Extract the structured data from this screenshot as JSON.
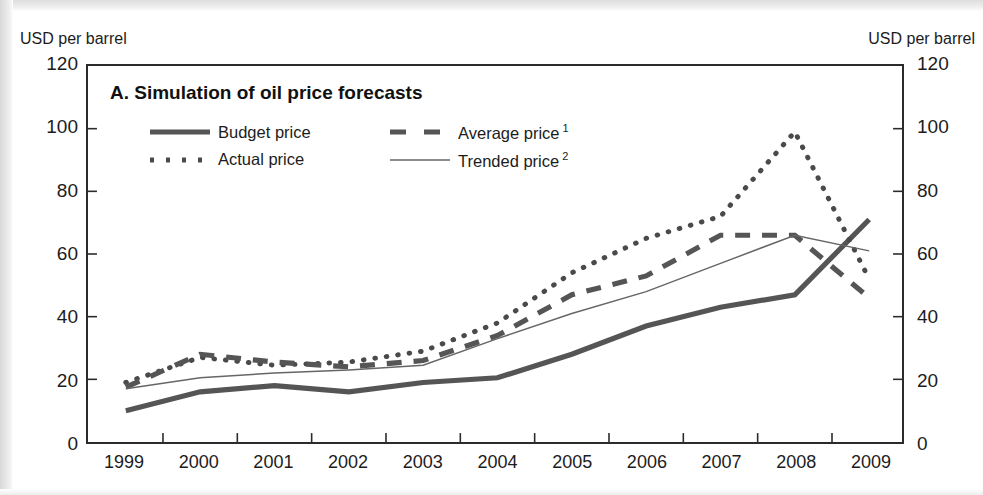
{
  "chart_data": {
    "type": "line",
    "title": "A. Simulation of oil price forecasts",
    "xlabel": "",
    "ylabel": "USD per barrel",
    "y_axis_unit_left": "USD per barrel",
    "y_axis_unit_right": "USD per barrel",
    "x": [
      1999,
      2000,
      2001,
      2002,
      2003,
      2004,
      2005,
      2006,
      2007,
      2008,
      2009
    ],
    "categories": [
      "1999",
      "2000",
      "2001",
      "2002",
      "2003",
      "2004",
      "2005",
      "2006",
      "2007",
      "2008",
      "2009"
    ],
    "ylim": [
      0,
      120
    ],
    "yticks": [
      0,
      20,
      40,
      60,
      80,
      100,
      120
    ],
    "ytick_labels": [
      "0",
      "20",
      "40",
      "60",
      "80",
      "100",
      "120"
    ],
    "grid": false,
    "legend_position": "inside-top-left",
    "series": [
      {
        "name": "Budget price",
        "style": "thick-solid",
        "color": "#555555",
        "values": [
          10,
          16,
          18,
          16,
          19,
          20.5,
          28,
          37,
          43,
          47,
          71
        ]
      },
      {
        "name": "Actual price",
        "style": "dotted",
        "color": "#4a4a4a",
        "values": [
          19,
          27,
          24.5,
          25.5,
          29,
          38,
          54,
          65,
          72,
          99,
          52
        ]
      },
      {
        "name": "Average price",
        "footnote_marker": "1",
        "style": "thick-dashed",
        "color": "#555555",
        "values": [
          17.5,
          28,
          25.5,
          24,
          26,
          34,
          47,
          53,
          66,
          66,
          46
        ]
      },
      {
        "name": "Trended price",
        "footnote_marker": "2",
        "style": "thin-solid",
        "color": "#666666",
        "values": [
          17,
          20.5,
          22,
          23,
          24.5,
          33,
          41,
          48,
          57,
          66,
          61
        ]
      }
    ]
  },
  "panel": {
    "title": "A. Simulation of oil price forecasts"
  },
  "axes": {
    "unit_left": "USD per barrel",
    "unit_right": "USD per barrel",
    "y_labels": [
      "120",
      "100",
      "80",
      "60",
      "40",
      "20",
      "0"
    ],
    "x_labels": [
      "1999",
      "2000",
      "2001",
      "2002",
      "2003",
      "2004",
      "2005",
      "2006",
      "2007",
      "2008",
      "2009"
    ]
  },
  "legend": {
    "items": [
      {
        "label": "Budget price",
        "marker": "thick-solid-line-swatch",
        "footnote": ""
      },
      {
        "label": "Average price",
        "marker": "thick-dashed-line-swatch",
        "footnote": "1"
      },
      {
        "label": "Actual price",
        "marker": "dotted-line-swatch",
        "footnote": ""
      },
      {
        "label": "Trended price",
        "marker": "thin-solid-line-swatch",
        "footnote": "2"
      }
    ]
  },
  "colors": {
    "line_dark": "#555555",
    "line_thin": "#666666",
    "frame": "#2b2b2b",
    "text": "#1c1c1c",
    "background": "#ffffff"
  }
}
